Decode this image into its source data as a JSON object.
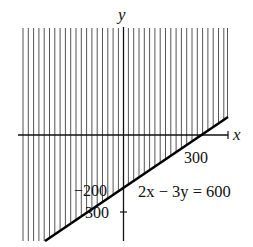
{
  "figure": {
    "type": "inequality-graph",
    "axes": {
      "x_label": "x",
      "y_label": "y"
    },
    "tick_labels": {
      "x_300": "300",
      "y_neg200": "−200",
      "y_300": "300"
    },
    "equation_label": "2x − 3y = 600",
    "shading": "vertical hatching above the line",
    "colors": {
      "hatch": "#555555",
      "line": "#000000",
      "axis": "#111111"
    }
  }
}
